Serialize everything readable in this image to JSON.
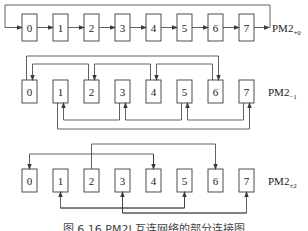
{
  "nodes": [
    "0",
    "1",
    "2",
    "3",
    "4",
    "5",
    "6",
    "7"
  ],
  "rows": [
    {
      "label_main": "PM2",
      "label_sub": "+0",
      "connections": [
        {
          "from": 0,
          "to": 1
        },
        {
          "from": 1,
          "to": 2
        },
        {
          "from": 2,
          "to": 3
        },
        {
          "from": 3,
          "to": 4
        },
        {
          "from": 4,
          "to": 5
        },
        {
          "from": 5,
          "to": 6
        },
        {
          "from": 6,
          "to": 7
        },
        {
          "from": 7,
          "to": 0
        }
      ]
    },
    {
      "label_main": "PM2",
      "label_sub": "−1",
      "connections": [
        {
          "from": 2,
          "to": 0
        },
        {
          "from": 4,
          "to": 2
        },
        {
          "from": 6,
          "to": 4
        },
        {
          "from": 0,
          "to": 6
        },
        {
          "from": 3,
          "to": 1
        },
        {
          "from": 5,
          "to": 3
        },
        {
          "from": 7,
          "to": 5
        },
        {
          "from": 1,
          "to": 7
        }
      ]
    },
    {
      "label_main": "PM2",
      "label_sub": "±2",
      "connections": [
        {
          "from": 4,
          "to": 0
        },
        {
          "from": 2,
          "to": 6
        },
        {
          "from": 1,
          "to": 5
        },
        {
          "from": 3,
          "to": 7
        }
      ]
    }
  ],
  "caption": "图 6.16   PM2I 互连网络的部分连接图"
}
